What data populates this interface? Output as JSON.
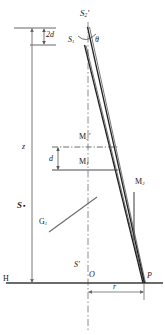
{
  "figure": {
    "type": "optical-ray-diagram",
    "background_color": "#ffffff",
    "line_color": "#2b2b2b",
    "axis_color": "#555555"
  },
  "labels": {
    "source_virtual_upper": {
      "text": "S",
      "sub": "2",
      "prime": "′",
      "x": 82,
      "y": 12
    },
    "source_virtual_lower": {
      "text": "S",
      "sub": "1",
      "prime": "",
      "x": 70,
      "y": 39
    },
    "angle_theta": {
      "text": "θ",
      "x": 97,
      "y": 40
    },
    "separation_2d": {
      "text": "2d",
      "x": 47,
      "y": 35
    },
    "separation_d": {
      "text": "d",
      "x": 50,
      "y": 159
    },
    "height_z": {
      "text": "z",
      "x": 22,
      "y": 147
    },
    "source_point_S": {
      "text": "S",
      "bullet": "▪",
      "x": 18,
      "y": 206
    },
    "mirror_M2_prime": {
      "text": "M",
      "sub": "2",
      "prime": "′",
      "x": 80,
      "y": 137
    },
    "mirror_M1": {
      "text": "M",
      "sub": "1",
      "prime": "",
      "x": 80,
      "y": 161
    },
    "mirror_M2": {
      "text": "M",
      "sub": "2",
      "prime": "",
      "x": 137,
      "y": 182
    },
    "grating_G1": {
      "text": "G",
      "sub": "1",
      "prime": "",
      "x": 41,
      "y": 221
    },
    "image_S_prime": {
      "text": "S",
      "prime": "′",
      "x": 76,
      "y": 264
    },
    "origin_O": {
      "text": "O",
      "x": 89,
      "y": 275
    },
    "point_P": {
      "text": "P",
      "x": 148,
      "y": 276
    },
    "baseline_H": {
      "text": "H",
      "x": 3,
      "y": 277
    },
    "distance_r": {
      "text": "r",
      "x": 115,
      "y": 290
    }
  },
  "geometry": {
    "horizontal_baseline": {
      "y": 283,
      "x1": 5,
      "x2": 163
    },
    "vertical_axis": {
      "x": 88,
      "y1": 22,
      "y2": 330
    },
    "converge_point": {
      "x": 144,
      "y": 283
    },
    "beam_top_upper": {
      "x": 86,
      "y": 28
    },
    "beam_top_lower": {
      "x": 84,
      "y": 44
    },
    "z_arrow": {
      "x": 32,
      "y1": 28,
      "y2": 283
    },
    "tick_top": {
      "y": 28,
      "x1": 14,
      "x2": 55
    },
    "tick_2d_bottom": {
      "y": 45,
      "x1": 28,
      "x2": 55
    },
    "m2prime_line": {
      "y": 147,
      "x1": 52,
      "x2": 118,
      "style": "dash-dot"
    },
    "m1_line": {
      "y": 170,
      "x1": 52,
      "x2": 118,
      "style": "solid"
    },
    "m2_mirror": {
      "x": 134,
      "y1": 192,
      "y2": 240
    },
    "g1_line": {
      "x1": 49,
      "y1": 231,
      "x2": 96,
      "y2": 198
    },
    "r_dimension": {
      "y": 293,
      "x1": 88,
      "x2": 144
    }
  }
}
